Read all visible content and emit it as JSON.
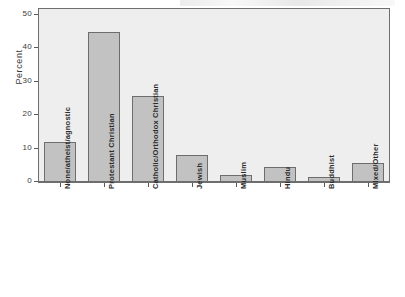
{
  "chart_data": {
    "type": "bar",
    "title": "",
    "subtitle": "",
    "xlabel": "",
    "ylabel": "Percent",
    "ylim": [
      0,
      52
    ],
    "grid": false,
    "legend": "none",
    "categories": [
      "None/atheist/agnostic",
      "Protestant Christian",
      "Catholic/Orthodox Christian",
      "Jewish",
      "Muslim",
      "Hindu",
      "Buddhist",
      "Mixed/Other"
    ],
    "values": [
      12.0,
      44.8,
      25.6,
      8.1,
      2.0,
      4.6,
      1.4,
      5.7
    ],
    "ytick_labels": [
      "0",
      "10",
      "20",
      "30",
      "40",
      "50"
    ],
    "ytick_values": [
      0,
      10,
      20,
      30,
      40,
      50
    ]
  },
  "style": {
    "plot_background": "#eeeeee",
    "bar_fill": "#c2c2c2",
    "bar_border": "#6d6d6d",
    "axis_color": "#6e6e6e",
    "text_color": "#2b2b2b",
    "page_background": "#ffffff"
  }
}
